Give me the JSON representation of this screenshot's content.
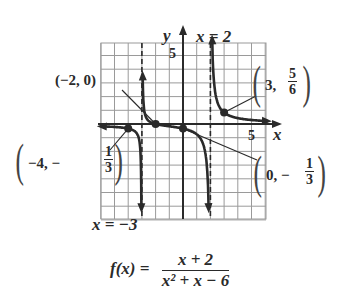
{
  "chart_data": {
    "type": "line",
    "title": "",
    "function": "f(x) = (x + 2) / (x^2 + x - 6)",
    "xlabel": "x",
    "ylabel": "y",
    "xlim": [
      -6,
      6
    ],
    "ylim": [
      -7,
      6
    ],
    "grid": true,
    "tick_labels": {
      "x": [
        "5"
      ],
      "y": [
        "5"
      ]
    },
    "vertical_asymptotes": [
      {
        "x": -3,
        "label": "x = −3"
      },
      {
        "x": 2,
        "label": "x = 2"
      }
    ],
    "horizontal_asymptote": {
      "y": 0
    },
    "labeled_points": [
      {
        "x": -2,
        "y": 0,
        "label": "(−2, 0)"
      },
      {
        "x": 3,
        "y": 0.8333,
        "label": "(3, 5/6)"
      },
      {
        "x": -4,
        "y": -0.3333,
        "label": "(−4, −1/3)"
      },
      {
        "x": 0,
        "y": -0.3333,
        "label": "(0, −1/3)"
      }
    ],
    "series": [
      {
        "name": "left branch",
        "x_range": [
          -6,
          -3
        ]
      },
      {
        "name": "middle branch",
        "x_range": [
          -3,
          2
        ]
      },
      {
        "name": "right branch",
        "x_range": [
          2,
          6
        ]
      }
    ]
  },
  "labels": {
    "y_axis": "y",
    "x_axis": "x",
    "asym_right": "x = 2",
    "asym_left": "x = −3",
    "tick_y5": "5",
    "tick_x5": "5",
    "pt_neg2": "(−2, 0)",
    "pt_3_prefix": "3,",
    "pt_3_num": "5",
    "pt_3_den": "6",
    "pt_neg4_prefix": "−4, −",
    "pt_neg4_num": "1",
    "pt_neg4_den": "3",
    "pt_0_prefix": "0, −",
    "pt_0_num": "1",
    "pt_0_den": "3"
  },
  "formula": {
    "lhs": "f(x) =",
    "numerator": "x + 2",
    "denominator": "x² + x − 6"
  }
}
